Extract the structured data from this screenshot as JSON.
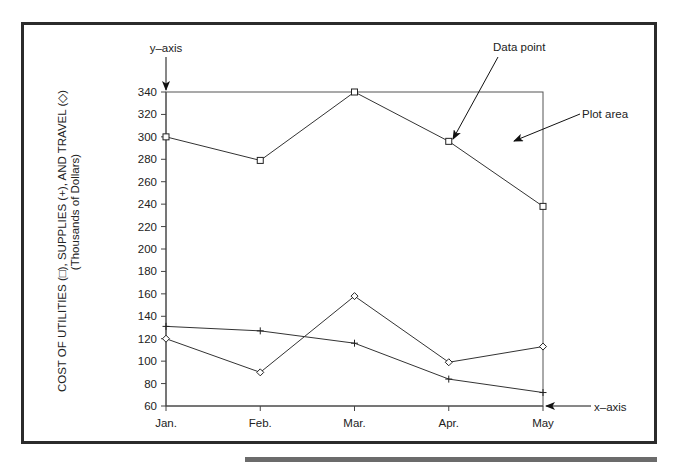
{
  "figure": {
    "y_axis_callout": "y–axis",
    "x_axis_callout": "x–axis",
    "data_point_callout": "Data point",
    "plot_area_callout": "Plot area",
    "ylabel_line1": "COST OF UTILITIES (□), SUPPLIES (+), AND TRAVEL (◇)",
    "ylabel_line2": "(Thousands of Dollars)"
  },
  "chart_data": {
    "type": "line",
    "title": "",
    "xlabel": "",
    "ylabel": "COST OF UTILITIES (□), SUPPLIES (+), AND TRAVEL (◇) (Thousands of Dollars)",
    "categories": [
      "Jan.",
      "Feb.",
      "Mar.",
      "Apr.",
      "May"
    ],
    "yticks": [
      60,
      80,
      100,
      120,
      140,
      160,
      180,
      200,
      220,
      240,
      260,
      280,
      300,
      320,
      340
    ],
    "ylim": [
      60,
      340
    ],
    "grid": false,
    "series": [
      {
        "name": "Utilities",
        "marker": "square",
        "values": [
          300,
          279,
          340,
          296,
          238
        ]
      },
      {
        "name": "Supplies",
        "marker": "plus",
        "values": [
          131,
          127,
          116,
          84,
          72
        ]
      },
      {
        "name": "Travel",
        "marker": "diamond",
        "values": [
          120,
          90,
          158,
          99,
          113
        ]
      }
    ],
    "annotations": [
      {
        "text": "y–axis",
        "points_to": "y-axis top"
      },
      {
        "text": "x–axis",
        "points_to": "x-axis right end"
      },
      {
        "text": "Data point",
        "points_to": "Utilities Apr. point"
      },
      {
        "text": "Plot area",
        "points_to": "interior of plot"
      }
    ]
  }
}
